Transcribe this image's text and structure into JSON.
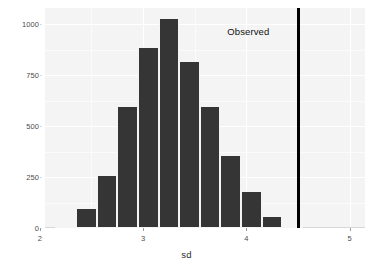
{
  "chart_data": {
    "type": "bar",
    "title": "",
    "subtitle": "",
    "xlabel": "sd",
    "ylabel": "count",
    "xlim": [
      2.05,
      5.15
    ],
    "ylim": [
      0,
      1080
    ],
    "grid": true,
    "legend": false,
    "x_ticks": [
      {
        "value": 2,
        "label": "2"
      },
      {
        "value": 3,
        "label": "3"
      },
      {
        "value": 4,
        "label": "4"
      },
      {
        "value": 5,
        "label": "5"
      }
    ],
    "y_ticks": [
      {
        "value": 0,
        "label": "0"
      },
      {
        "value": 250,
        "label": "250"
      },
      {
        "value": 500,
        "label": "500"
      },
      {
        "value": 750,
        "label": "750"
      },
      {
        "value": 1000,
        "label": "1000"
      }
    ],
    "bin_width": 0.2,
    "bins": [
      {
        "x0": 2.15,
        "x1": 2.35,
        "center": 2.25,
        "count": 10
      },
      {
        "x0": 2.35,
        "x1": 2.55,
        "center": 2.45,
        "count": 100
      },
      {
        "x0": 2.55,
        "x1": 2.75,
        "center": 2.65,
        "count": 262
      },
      {
        "x0": 2.75,
        "x1": 2.95,
        "center": 2.85,
        "count": 598
      },
      {
        "x0": 2.95,
        "x1": 3.15,
        "center": 3.05,
        "count": 890
      },
      {
        "x0": 3.15,
        "x1": 3.35,
        "center": 3.25,
        "count": 1030
      },
      {
        "x0": 3.35,
        "x1": 3.55,
        "center": 3.45,
        "count": 822
      },
      {
        "x0": 3.55,
        "x1": 3.75,
        "center": 3.65,
        "count": 600
      },
      {
        "x0": 3.75,
        "x1": 3.95,
        "center": 3.85,
        "count": 360
      },
      {
        "x0": 3.95,
        "x1": 4.15,
        "center": 4.05,
        "count": 180
      },
      {
        "x0": 4.15,
        "x1": 4.35,
        "center": 4.25,
        "count": 58
      },
      {
        "x0": 4.35,
        "x1": 4.55,
        "center": 4.45,
        "count": 12
      }
    ],
    "categories": [
      "2.25",
      "2.45",
      "2.65",
      "2.85",
      "3.05",
      "3.25",
      "3.45",
      "3.65",
      "3.85",
      "4.05",
      "4.25",
      "4.45"
    ],
    "values": [
      10,
      100,
      262,
      598,
      890,
      1030,
      822,
      600,
      360,
      180,
      58,
      12
    ],
    "annotations": [
      {
        "id": "observed-line",
        "kind": "vline",
        "x": 4.51,
        "color": "#000000",
        "width": 3
      },
      {
        "id": "observed-label",
        "kind": "text",
        "text": "Observed",
        "x": 4.02,
        "y": 960
      }
    ],
    "colors": {
      "bar_fill": "#353535",
      "panel_background": "#f4f4f4",
      "gridline": "#ffffff",
      "annotation_line": "#000000",
      "text": "#2b2b2b"
    }
  }
}
